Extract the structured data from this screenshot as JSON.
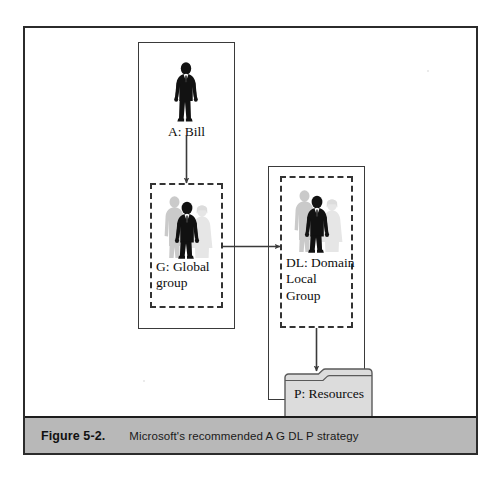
{
  "figure": {
    "caption_number": "Figure 5-2.",
    "caption_text": "Microsoft's recommended A G DL P strategy",
    "frame_color": "#2b2b2b",
    "caption_bar_color": "#b8b8b8"
  },
  "diagram": {
    "type": "flow",
    "nodes": [
      {
        "id": "account",
        "label": "A: Bill",
        "icon": "single-person-icon",
        "container": "solid-box-left",
        "style": "solid"
      },
      {
        "id": "global_group",
        "label": "G: Global\ngroup",
        "icon": "person-group-icon",
        "container": "solid-box-left",
        "style": "dashed"
      },
      {
        "id": "domain_local_group",
        "label": "DL: Domain\nLocal\nGroup",
        "icon": "person-group-icon",
        "container": "solid-box-right",
        "style": "dashed"
      },
      {
        "id": "resources",
        "label": "P: Resources",
        "icon": "folder-icon",
        "container": "solid-box-right",
        "style": "solid"
      }
    ],
    "edges": [
      {
        "from": "account",
        "to": "global_group",
        "direction": "down"
      },
      {
        "from": "global_group",
        "to": "domain_local_group",
        "direction": "right"
      },
      {
        "from": "domain_local_group",
        "to": "resources",
        "direction": "down"
      }
    ],
    "colors": {
      "arrow": "#3a3a3a",
      "dashed_border": "#333333",
      "solid_border": "#3a3a3a",
      "icon_dark": "#111111",
      "icon_mid_gray": "#c4c4c4",
      "icon_light_gray": "#e4e4e4",
      "folder_fill": "#dcdcdc",
      "folder_stroke": "#5a5a5a"
    }
  }
}
